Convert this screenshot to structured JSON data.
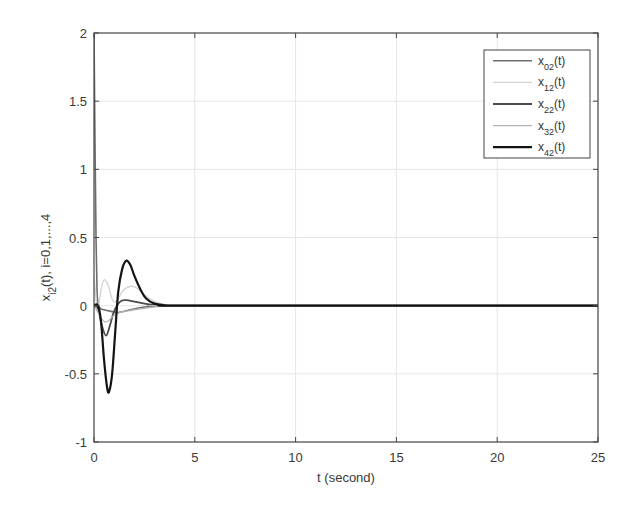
{
  "chart_data": {
    "type": "line",
    "title": "",
    "xlabel": "t (second)",
    "ylabel": "x_{i2}(t), i=0,1,...,4",
    "xlim": [
      0,
      25
    ],
    "ylim": [
      -1,
      2
    ],
    "xticks": [
      0,
      5,
      10,
      15,
      20,
      25
    ],
    "yticks": [
      -1,
      -0.5,
      0,
      0.5,
      1,
      1.5,
      2
    ],
    "xtick_labels": [
      "0",
      "5",
      "10",
      "15",
      "20",
      "25"
    ],
    "ytick_labels": [
      "-1",
      "-0.5",
      "0",
      "0.5",
      "1",
      "1.5",
      "2"
    ],
    "grid": true,
    "legend_position": "upper right",
    "series": [
      {
        "name": "x02(t)",
        "label_base": "x",
        "label_sub": "02",
        "label_tail": "(t)",
        "color": "#6e6e6e",
        "width": 1.6,
        "x": [
          0,
          0.05,
          0.1,
          0.15,
          0.2,
          0.3,
          0.5,
          0.8,
          1.2,
          1.8,
          2.5,
          3.5,
          5,
          25
        ],
        "y": [
          2,
          1.2,
          0.5,
          0.12,
          0.02,
          -0.02,
          -0.03,
          -0.04,
          -0.05,
          -0.03,
          -0.01,
          0,
          0,
          0
        ]
      },
      {
        "name": "x12(t)",
        "label_base": "x",
        "label_sub": "12",
        "label_tail": "(t)",
        "color": "#d2d2d2",
        "width": 1.3,
        "x": [
          0,
          0.1,
          0.2,
          0.35,
          0.5,
          0.7,
          0.9,
          1.1,
          1.5,
          2.0,
          2.5,
          3.0,
          3.5,
          4.5,
          25
        ],
        "y": [
          0.22,
          0.05,
          -0.02,
          0.12,
          0.19,
          0.15,
          0.05,
          0.03,
          0.12,
          0.14,
          0.08,
          0.03,
          0.01,
          0,
          0
        ]
      },
      {
        "name": "x22(t)",
        "label_base": "x",
        "label_sub": "22",
        "label_tail": "(t)",
        "color": "#4a4a4a",
        "width": 1.8,
        "x": [
          0,
          0.2,
          0.4,
          0.6,
          0.8,
          1.0,
          1.3,
          1.6,
          2.0,
          2.5,
          3.0,
          3.5,
          4.5,
          25
        ],
        "y": [
          0,
          -0.02,
          -0.15,
          -0.22,
          -0.14,
          -0.04,
          0.03,
          0.04,
          0.03,
          0.015,
          0.005,
          0,
          0,
          0
        ]
      },
      {
        "name": "x32(t)",
        "label_base": "x",
        "label_sub": "32",
        "label_tail": "(t)",
        "color": "#b4b4b4",
        "width": 1.3,
        "x": [
          0,
          0.2,
          0.4,
          0.6,
          0.8,
          1.0,
          1.3,
          1.6,
          2.0,
          2.5,
          3.0,
          3.5,
          4.5,
          25
        ],
        "y": [
          0,
          -0.05,
          -0.1,
          -0.12,
          -0.1,
          -0.07,
          -0.05,
          -0.04,
          -0.03,
          -0.02,
          -0.01,
          0,
          0,
          0
        ]
      },
      {
        "name": "x42(t)",
        "label_base": "x",
        "label_sub": "42",
        "label_tail": "(t)",
        "color": "#141414",
        "width": 2.2,
        "x": [
          0,
          0.2,
          0.35,
          0.5,
          0.65,
          0.75,
          0.9,
          1.05,
          1.2,
          1.4,
          1.6,
          1.8,
          2.0,
          2.3,
          2.6,
          3.0,
          3.5,
          4.0,
          5,
          25
        ],
        "y": [
          0,
          0,
          -0.12,
          -0.4,
          -0.6,
          -0.63,
          -0.5,
          -0.2,
          0.1,
          0.27,
          0.33,
          0.3,
          0.22,
          0.12,
          0.05,
          0.015,
          0.003,
          0,
          0,
          0
        ]
      }
    ]
  },
  "plot": {
    "left": 94,
    "right": 598,
    "top": 33,
    "bottom": 442,
    "axis_color": "#444444",
    "grid_color": "#e6e6e6"
  },
  "legend": {
    "left": 484,
    "top": 50,
    "width": 106,
    "height": 108
  }
}
